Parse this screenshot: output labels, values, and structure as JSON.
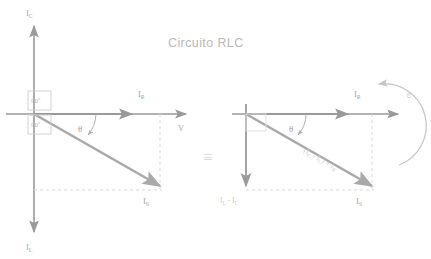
{
  "title": "Circuito RLC",
  "colors": {
    "axis": "#9a9a9a",
    "vector": "#a9a9a9",
    "dashed": "#d8d8d8",
    "title": "#b9b9b9",
    "label": "#a8a8a8",
    "faint_label": "#cccccc",
    "background": "#ffffff"
  },
  "left_diagram": {
    "name": "phasor-diagram-left",
    "axis_labels": {
      "vertical_top": "I",
      "vertical_top_sub": "C",
      "vertical_bottom": "I",
      "vertical_bottom_sub": "L",
      "horizontal_end": "V"
    },
    "vectors": [
      {
        "name": "resistive-current",
        "label": "I",
        "sub": "R"
      },
      {
        "name": "capacitive-current",
        "label": "I",
        "sub": "C"
      },
      {
        "name": "inductive-current",
        "label": "I",
        "sub": "L"
      },
      {
        "name": "source-current",
        "label": "I",
        "sub": "S"
      }
    ],
    "angle_boxes": [
      {
        "name": "angle-box-upper",
        "value": "90º"
      },
      {
        "name": "angle-box-lower",
        "value": "90º"
      }
    ],
    "theta_label": "θ"
  },
  "equivalence_symbol": "≡",
  "right_diagram": {
    "name": "phasor-diagram-right",
    "vectors": [
      {
        "name": "resistive-current",
        "label": "I",
        "sub": "R"
      },
      {
        "name": "net-reactive-current",
        "label": "I",
        "sub": "L",
        "expr_rest": " - I",
        "expr_sub2": "C"
      },
      {
        "name": "source-current",
        "label": "I",
        "sub": "S"
      }
    ],
    "resultant_label": {
      "open": "(I",
      "sub1": "C",
      "mid": " - I",
      "sub2": "L",
      "close": ") + I",
      "sub3": "R"
    },
    "theta_label": "θ",
    "omega_label": "ω"
  }
}
